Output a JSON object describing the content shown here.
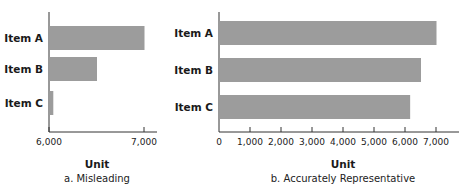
{
  "chart_data": [
    {
      "type": "bar",
      "orientation": "horizontal",
      "categories": [
        "Item A",
        "Item B",
        "Item C"
      ],
      "values": [
        7000,
        6500,
        6040
      ],
      "xlabel": "Unit",
      "caption": "a. Misleading",
      "xlim": [
        6000,
        7000
      ],
      "ticks": [
        6000,
        7000
      ],
      "tick_labels": [
        "6,000",
        "7,000"
      ],
      "grid": false,
      "bar_color": "#9c9c9c"
    },
    {
      "type": "bar",
      "orientation": "horizontal",
      "categories": [
        "Item A",
        "Item B",
        "Item C"
      ],
      "values": [
        7000,
        6500,
        6150
      ],
      "xlabel": "Unit",
      "caption": "b. Accurately Representative",
      "xlim": [
        0,
        7000
      ],
      "ticks": [
        0,
        1000,
        2000,
        3000,
        4000,
        5000,
        6000,
        7000
      ],
      "tick_labels": [
        "0",
        "1,000",
        "2,000",
        "3,000",
        "4,000",
        "5,000",
        "6,000",
        "7,000"
      ],
      "grid": false,
      "bar_color": "#9c9c9c"
    }
  ]
}
